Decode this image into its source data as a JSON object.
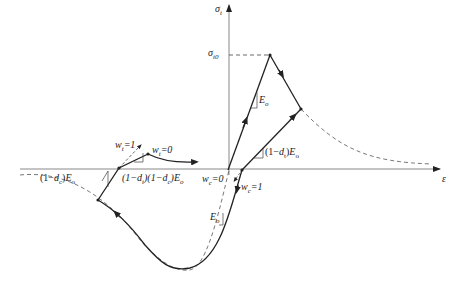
{
  "diagram": {
    "type": "stress-strain damage model (tension/compression cyclic)",
    "axes": {
      "y_label": "σ",
      "y_label_sub": "t",
      "x_label": "ε",
      "peak_label": "σ",
      "peak_label_sub": "t0"
    },
    "labels": {
      "tension_modulus": {
        "pre": "",
        "sym": "E",
        "sub": "o"
      },
      "tension_unload": {
        "pre": "(1−",
        "d": "d",
        "dsub": "t",
        "post": ")",
        "sym": "E",
        "sub": "o"
      },
      "compression_unload": {
        "pre": "(1−",
        "d": "d",
        "dsub": "c",
        "post": ")",
        "sym": "E",
        "sub": "o"
      },
      "combined": {
        "text": "(1−d",
        "sub1": "t",
        "mid": ")(1−d",
        "sub2": "c",
        "post": ")E",
        "sub3": "o"
      },
      "compression_modulus": {
        "sym": "E",
        "sub": "o"
      },
      "wt1": {
        "w": "w",
        "sub": "t",
        "val": "=1"
      },
      "wt0": {
        "w": "w",
        "sub": "t",
        "val": "=0"
      },
      "wc0": {
        "w": "w",
        "sub": "c",
        "val": "=0"
      },
      "wc1": {
        "w": "w",
        "sub": "c",
        "val": "=1"
      }
    },
    "colors": {
      "line": "#222222",
      "axis": "#888888",
      "dashed": "#666666"
    }
  }
}
